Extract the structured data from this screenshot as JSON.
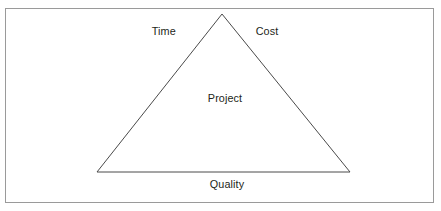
{
  "diagram": {
    "type": "project-management-triangle",
    "title_visible": false,
    "center_label": "Project",
    "vertices_labels": {
      "top_left_edge": "Time",
      "top_right_edge": "Cost",
      "bottom_edge": "Quality"
    },
    "labels": [
      {
        "id": "time",
        "text": "Time",
        "position": "upper-left"
      },
      {
        "id": "cost",
        "text": "Cost",
        "position": "upper-right"
      },
      {
        "id": "project",
        "text": "Project",
        "position": "center"
      },
      {
        "id": "quality",
        "text": "Quality",
        "position": "below-base"
      }
    ],
    "geometry": {
      "apex": {
        "x": 222,
        "y": 14
      },
      "bottom_left": {
        "x": 97,
        "y": 172
      },
      "bottom_right": {
        "x": 350,
        "y": 172
      }
    },
    "colors": {
      "background": "#ffffff",
      "frame_border": "#9a9a9a",
      "triangle_stroke": "#4a4a4a",
      "text": "#231f20"
    }
  }
}
